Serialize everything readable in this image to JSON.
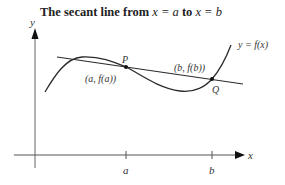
{
  "title": {
    "prefix": "The secant line from ",
    "expr1": "x = a",
    "middle": " to ",
    "expr2": "x = b"
  },
  "axes": {
    "x_label": "x",
    "y_label": "y",
    "ticks": [
      {
        "label": "a"
      },
      {
        "label": "b"
      }
    ]
  },
  "curve": {
    "label": "y = f(x)"
  },
  "points": [
    {
      "name": "P",
      "coord_label": "(a, f(a))"
    },
    {
      "name": "Q",
      "coord_label": "(b, f(b))"
    }
  ],
  "colors": {
    "line": "#2a2a2a",
    "axis": "#555555",
    "text": "#333333"
  }
}
